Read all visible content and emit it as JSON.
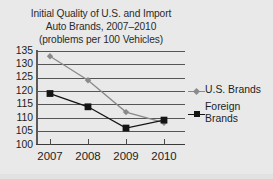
{
  "figure": {
    "background_color": "#e9e9e9",
    "width": 273,
    "height": 179
  },
  "chart_data": {
    "type": "line",
    "title": "Initial Quality of U.S. and Import Auto Brands, 2007–2010 (problems per 100 Vehicles)",
    "title_lines": [
      "Initial Quality of U.S. and Import",
      "Auto Brands, 2007–2010",
      "(problems per 100 Vehicles)"
    ],
    "xlabel": "",
    "ylabel": "",
    "categories": [
      "2007",
      "2008",
      "2009",
      "2010"
    ],
    "x": [
      2007,
      2008,
      2009,
      2010
    ],
    "ylim": [
      100,
      135
    ],
    "yticks": [
      100,
      105,
      110,
      115,
      120,
      125,
      130,
      135
    ],
    "ytick_labels": [
      "100",
      "105",
      "110",
      "115",
      "120",
      "125",
      "130",
      "135"
    ],
    "xtick_labels": [
      "2007",
      "2008",
      "2009",
      "2010"
    ],
    "grid": true,
    "grid_axis": "y",
    "legend_position": "right",
    "series": [
      {
        "name": "U.S. Brands",
        "values": [
          133,
          124,
          112,
          108
        ],
        "color": "#8a8a8a",
        "marker": "diamond",
        "marker_color": "#8a8a8a"
      },
      {
        "name": "Foreign Brands",
        "values": [
          119,
          114,
          106,
          109
        ],
        "color": "#141414",
        "marker": "square",
        "marker_color": "#141414"
      }
    ]
  },
  "legend": {
    "entries": [
      {
        "label": "U.S. Brands",
        "marker": "diamond-marker",
        "color": "#8a8a8a"
      },
      {
        "label": "Foreign\nBrands",
        "marker": "square-marker",
        "color": "#141414"
      }
    ]
  },
  "axes": {
    "y_tick_labels": [
      "135",
      "130",
      "125",
      "120",
      "115",
      "110",
      "105",
      "100"
    ],
    "x_tick_labels": [
      "2007",
      "2008",
      "2009",
      "2010"
    ]
  },
  "colors": {
    "background": "#e9e9e9",
    "gridline": "#555555",
    "axis": "#3a3a3a",
    "text": "#1d1d1d",
    "us_brands": "#8a8a8a",
    "foreign_brands": "#141414"
  }
}
